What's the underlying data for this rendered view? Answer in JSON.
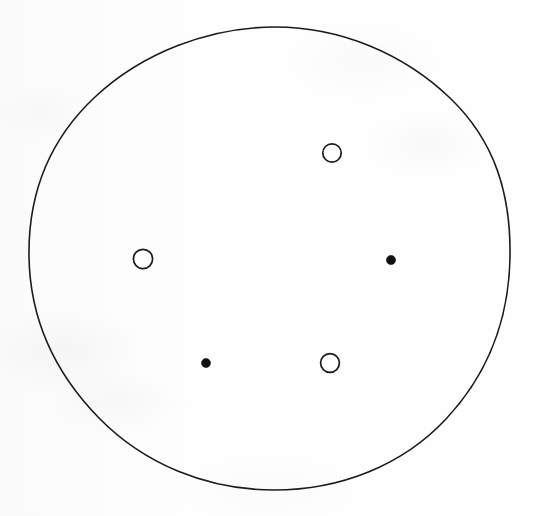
{
  "document": {
    "title": "Scanned circle diagram",
    "media": "scanned line drawing",
    "background_color": "#fefefe",
    "ink_color": "#1b1b1b",
    "canvas": {
      "width": 534,
      "height": 516
    }
  },
  "chart_data": {
    "type": "scatter",
    "title": "",
    "subtitle": "",
    "xlabel": "",
    "ylabel": "",
    "grid": false,
    "legend_position": "none",
    "xlim": [
      0,
      534
    ],
    "ylim": [
      0,
      516
    ],
    "annotations": [],
    "boundary": {
      "name": "outer-circle",
      "shape": "circle",
      "center_x": 270,
      "center_y": 259,
      "radius_x": 240,
      "radius_y": 231,
      "stroke": "#1b1b1b",
      "stroke_width": 1.6,
      "fill": "none"
    },
    "series": [
      {
        "name": "filled-markers",
        "marker": "filled-dot",
        "fill": "#111111",
        "stroke": "#111111",
        "radius": 4.3,
        "count": 3,
        "points": [
          {
            "label": "top-left-dot",
            "x": 206,
            "y": 154
          },
          {
            "label": "right-dot",
            "x": 391,
            "y": 260
          },
          {
            "label": "bottom-left-dot",
            "x": 206,
            "y": 363
          }
        ]
      },
      {
        "name": "open-markers",
        "marker": "open-circle",
        "fill": "#ffffff",
        "stroke": "#1b1b1b",
        "radius": 9.4,
        "count": 3,
        "points": [
          {
            "label": "top-right-ring",
            "x": 332,
            "y": 153
          },
          {
            "label": "left-ring",
            "x": 143,
            "y": 259
          },
          {
            "label": "bottom-right-ring",
            "x": 330,
            "y": 363
          }
        ]
      }
    ],
    "arrangement": {
      "pattern": "hexagonal ring, alternating filled and open markers",
      "ring_center_x": 268,
      "ring_center_y": 259,
      "ring_radius": 123,
      "total_markers": 6
    }
  }
}
